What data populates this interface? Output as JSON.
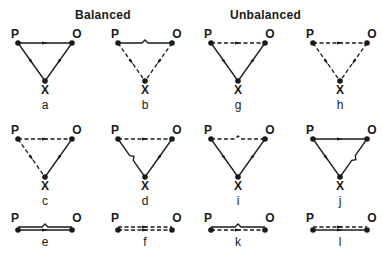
{
  "headings": {
    "balanced": "Balanced",
    "unbalanced": "Unbalanced"
  },
  "colors": {
    "ink": "#1a1a1a",
    "background": "#ffffff"
  },
  "nodes": {
    "p": "P",
    "o": "O",
    "x": "X"
  },
  "panels": [
    {
      "id": "a",
      "label": "a",
      "group": "balanced",
      "type": "triangle",
      "cx": 45,
      "top": 43,
      "edges": {
        "po": "solid",
        "px": "solid",
        "ox": "solid"
      },
      "arrows": {
        "po": "right"
      }
    },
    {
      "id": "b",
      "label": "b",
      "group": "balanced",
      "type": "triangle",
      "cx": 145,
      "top": 43,
      "edges": {
        "po": "solid-notch",
        "px": "dashed",
        "ox": "dashed"
      }
    },
    {
      "id": "g",
      "label": "g",
      "group": "unbalanced",
      "type": "triangle",
      "cx": 238,
      "top": 43,
      "edges": {
        "po": "dashed",
        "px": "solid",
        "ox": "solid"
      },
      "arrows": {
        "po": "left"
      }
    },
    {
      "id": "h",
      "label": "h",
      "group": "unbalanced",
      "type": "triangle",
      "cx": 340,
      "top": 43,
      "edges": {
        "po": "dashed",
        "px": "dashed",
        "ox": "dashed"
      },
      "arrows": {
        "po": "left"
      }
    },
    {
      "id": "c",
      "label": "c",
      "group": "balanced",
      "type": "triangle",
      "cx": 45,
      "top": 139,
      "edges": {
        "po": "dashed",
        "px": "dashed",
        "ox": "solid"
      },
      "arrows": {
        "po": "left"
      }
    },
    {
      "id": "d",
      "label": "d",
      "group": "balanced",
      "type": "triangle",
      "cx": 145,
      "top": 139,
      "edges": {
        "po": "dashed",
        "px": "solid-notch",
        "ox": "solid"
      },
      "arrows": {
        "po": "left"
      }
    },
    {
      "id": "i",
      "label": "i",
      "group": "unbalanced",
      "type": "triangle",
      "cx": 238,
      "top": 139,
      "edges": {
        "po": "dashed-notch",
        "px": "solid",
        "ox": "solid"
      }
    },
    {
      "id": "j",
      "label": "j",
      "group": "unbalanced",
      "type": "triangle",
      "cx": 340,
      "top": 139,
      "edges": {
        "po": "solid",
        "px": "solid",
        "ox": "solid-notch"
      },
      "arrows": {
        "po": "right"
      }
    },
    {
      "id": "e",
      "label": "e",
      "group": "balanced",
      "type": "pair",
      "cx": 45,
      "top": 230,
      "lines": [
        "solid-notch",
        "solid"
      ]
    },
    {
      "id": "f",
      "label": "f",
      "group": "balanced",
      "type": "pair",
      "cx": 145,
      "top": 230,
      "lines": [
        "dashed",
        "dashed"
      ]
    },
    {
      "id": "k",
      "label": "k",
      "group": "unbalanced",
      "type": "pair",
      "cx": 238,
      "top": 230,
      "lines": [
        "solid-notch",
        "dashed"
      ]
    },
    {
      "id": "l",
      "label": "l",
      "group": "unbalanced",
      "type": "pair",
      "cx": 340,
      "top": 230,
      "lines": [
        "dashed",
        "solid"
      ]
    }
  ]
}
